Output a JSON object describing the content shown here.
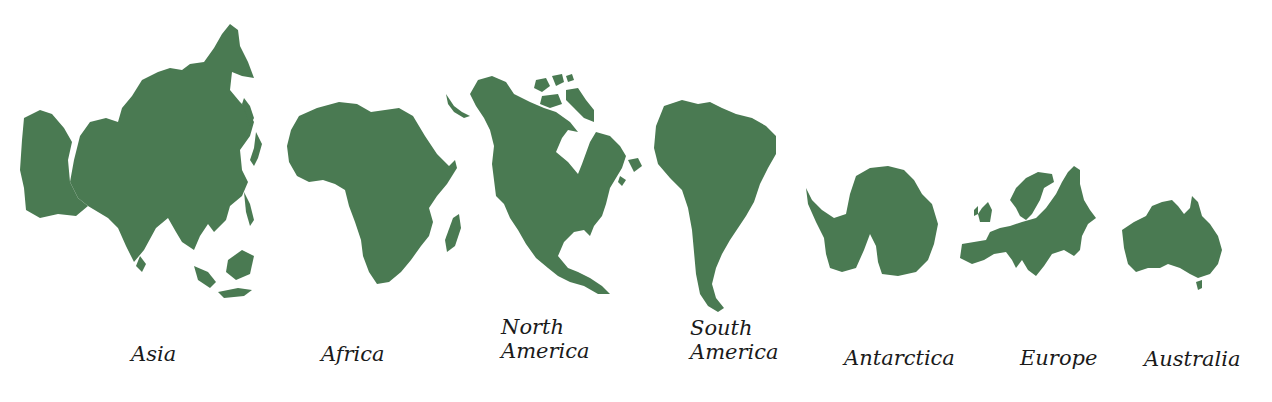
{
  "colors": {
    "land": "#4a7a52",
    "background": "#ffffff",
    "text": "#1a1a1a"
  },
  "continents": [
    {
      "id": "asia",
      "name": "Asia",
      "label_lines": [
        "Asia"
      ]
    },
    {
      "id": "africa",
      "name": "Africa",
      "label_lines": [
        "Africa"
      ]
    },
    {
      "id": "north-america",
      "name": "North America",
      "label_lines": [
        "North",
        "America"
      ]
    },
    {
      "id": "south-america",
      "name": "South America",
      "label_lines": [
        "South",
        "America"
      ]
    },
    {
      "id": "antarctica",
      "name": "Antarctica",
      "label_lines": [
        "Antarctica"
      ]
    },
    {
      "id": "europe",
      "name": "Europe",
      "label_lines": [
        "Europe"
      ]
    },
    {
      "id": "australia",
      "name": "Australia",
      "label_lines": [
        "Australia"
      ]
    }
  ]
}
